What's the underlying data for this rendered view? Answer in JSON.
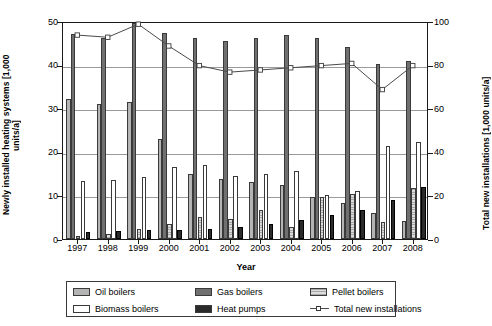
{
  "chart_data": {
    "type": "bar",
    "title": "",
    "xlabel": "Year",
    "ylabel": "Newly installed heating systems [1,000 units/a]",
    "y2label": "Total new installations [1,000 units/a]",
    "categories": [
      "1997",
      "1998",
      "1999",
      "2000",
      "2001",
      "2002",
      "2003",
      "2004",
      "2005",
      "2006",
      "2007",
      "2008"
    ],
    "ylim": [
      0,
      50
    ],
    "yticks": [
      0,
      10,
      20,
      30,
      40,
      50
    ],
    "y2lim": [
      0,
      100
    ],
    "y2ticks": [
      0,
      20,
      40,
      60,
      80,
      100
    ],
    "grid": true,
    "legend_position": "bottom",
    "series": [
      {
        "name": "Oil boilers",
        "axis": "left",
        "type": "bar",
        "values": [
          32.0,
          31.0,
          31.5,
          23.0,
          15.0,
          13.8,
          13.0,
          12.3,
          9.6,
          8.2,
          6.0,
          4.1
        ]
      },
      {
        "name": "Gas boilers",
        "axis": "left",
        "type": "bar",
        "values": [
          47.0,
          46.0,
          49.5,
          47.3,
          46.0,
          45.5,
          46.0,
          46.8,
          46.0,
          44.0,
          40.2,
          40.8
        ]
      },
      {
        "name": "Pellet boilers",
        "axis": "left",
        "type": "bar",
        "values": [
          0.6,
          1.1,
          2.2,
          3.4,
          5.0,
          4.6,
          6.7,
          2.8,
          9.7,
          10.3,
          3.9,
          11.8
        ]
      },
      {
        "name": "Biomass boilers",
        "axis": "left",
        "type": "bar",
        "values": [
          13.3,
          13.6,
          14.2,
          16.5,
          17.0,
          14.4,
          14.8,
          15.5,
          10.0,
          11.1,
          21.4,
          22.3
        ]
      },
      {
        "name": "Heat pumps",
        "axis": "left",
        "type": "bar",
        "values": [
          1.7,
          1.9,
          2.0,
          2.1,
          2.2,
          2.7,
          3.5,
          4.3,
          5.6,
          6.7,
          9.0,
          12.0
        ]
      },
      {
        "name": "Total new installations",
        "axis": "right",
        "type": "line",
        "values": [
          94,
          93,
          99,
          89,
          80,
          77,
          78,
          79,
          80,
          81,
          69,
          80
        ]
      }
    ]
  },
  "legend": {
    "items": [
      {
        "label": "Oil boilers",
        "marker": "swatch-oil"
      },
      {
        "label": "Gas boilers",
        "marker": "swatch-gas"
      },
      {
        "label": "Pellet boilers",
        "marker": "swatch-pellet"
      },
      {
        "label": "Biomass boilers",
        "marker": "swatch-biomass"
      },
      {
        "label": "Heat pumps",
        "marker": "swatch-heatpumps"
      },
      {
        "label": "Total new installations",
        "marker": "line-marker"
      }
    ]
  },
  "colors": {
    "oil": "#b4b4b4",
    "gas": "#707070",
    "pellet": "#c8c8c8",
    "biomass": "#ffffff",
    "heatpumps": "#2b2b2b",
    "line": "#4a4a4a",
    "axis": "#1a1a1a",
    "grid": "#9a9a9a"
  }
}
